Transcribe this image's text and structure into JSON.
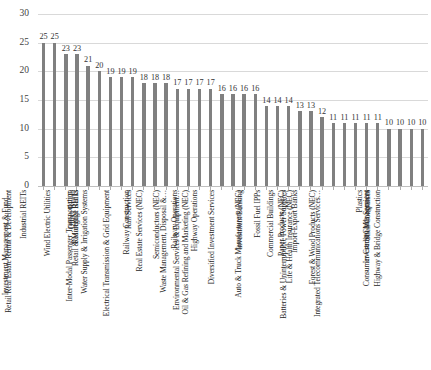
{
  "chart_data": {
    "type": "bar",
    "title": "",
    "xlabel": "",
    "ylabel": "",
    "ylim": [
      0,
      30
    ],
    "yticks": [
      0,
      5,
      10,
      15,
      20,
      25,
      30
    ],
    "grid": true,
    "legend": "none",
    "orientation": "vertical",
    "bar_color": "#808080",
    "data_labels": true,
    "xtick_rotation": 90,
    "categories": [
      "Industrial REITs",
      "Investment Management & Fund…",
      "Retail Real Estate Rental & Development",
      "Wind Electric Utilities",
      "Office REITs",
      "Residential REITs",
      "Retail & Mortgage Banks",
      "Inter-Modal Passenger Transportation",
      "Water Supply & Irrigation Systems",
      "Rail Services",
      "Railway Construction",
      "Electrical Transmission & Grid Equipment",
      "Real Estate Services (NEC)",
      "Semiconductors (NEC)",
      "Railway Operations",
      "Waste Management, Disposal &…",
      "Highway Operations",
      "Environmental Services & Equipment…",
      "Oil & Gas Refining and Marketing (NEC)",
      "Diversified Investment Services",
      "Investment Banking",
      "Fossil Fuel IPPs",
      "Auto & Truck Manufacturers (NEC)",
      "Commercial Buildings",
      "Paper Products (NEC)",
      "Import-Export Banks",
      "Life & Health Insurance (NEC)",
      "Batteries & Uninterruptible Power Supplies",
      "Forest & Wood Products (NEC)",
      "Plastics",
      "Integrated Telecommunications Services…",
      "Shell Companies",
      "Investment Management",
      "Consumer Credit Cards Services",
      "Highway & Bridge Construction"
    ],
    "values": [
      25,
      25,
      23,
      23,
      21,
      20,
      19,
      19,
      19,
      18,
      18,
      18,
      17,
      17,
      17,
      17,
      16,
      16,
      16,
      16,
      14,
      14,
      14,
      13,
      13,
      12,
      11,
      11,
      11,
      11,
      11,
      10,
      10,
      10,
      10
    ]
  }
}
